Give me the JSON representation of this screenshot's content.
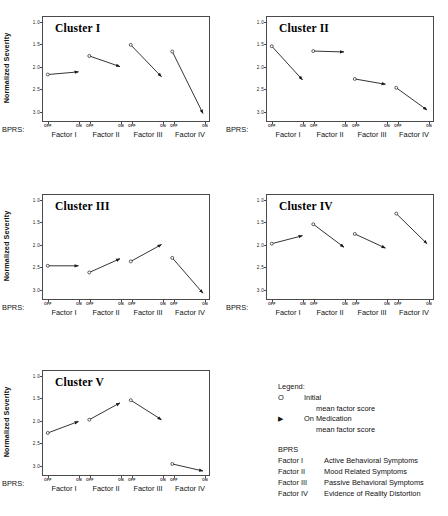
{
  "figure": {
    "axis": {
      "ylabel": "Normalized Severity",
      "xlabel_prefix": "BPRS:",
      "yticks": [
        "3.0",
        "2.5",
        "2.0",
        "1.5",
        "1.0"
      ],
      "ytick_values": [
        3.0,
        2.5,
        2.0,
        1.5,
        1.0
      ],
      "ylim": [
        0.75,
        3.1
      ],
      "factors": [
        "Factor I",
        "Factor II",
        "Factor III",
        "Factor IV"
      ],
      "condition_ticks": [
        "OFF",
        "ON"
      ]
    },
    "panels": [
      {
        "title": "Cluster I",
        "id": "cluster-1"
      },
      {
        "title": "Cluster II",
        "id": "cluster-2"
      },
      {
        "title": "Cluster III",
        "id": "cluster-3"
      },
      {
        "title": "Cluster IV",
        "id": "cluster-4"
      },
      {
        "title": "Cluster V",
        "id": "cluster-5"
      }
    ]
  },
  "legend": {
    "title": "Legend:",
    "entries": [
      {
        "marker": "O",
        "marker_name": "open-circle-marker",
        "label": "Initial",
        "sublabel": "mean factor score"
      },
      {
        "marker": "▶",
        "marker_name": "filled-arrow-marker",
        "label": "On Medication",
        "sublabel": "mean factor score"
      }
    ],
    "bprs_heading": "BPRS",
    "bprs_items": [
      {
        "key": "Factor I",
        "desc": "Active Behavioral Symptoms"
      },
      {
        "key": "Factor II",
        "desc": "Mood Related Symptoms"
      },
      {
        "key": "Factor III",
        "desc": "Passive Behavioral Symptoms"
      },
      {
        "key": "Factor IV",
        "desc": "Evidence of Reality Distortion"
      }
    ]
  },
  "chart_data": {
    "type": "line",
    "xlabel": "BPRS:",
    "ylabel": "Normalized Severity",
    "ylim": [
      0.75,
      3.1
    ],
    "yticks": [
      1.0,
      1.5,
      2.0,
      2.5,
      3.0
    ],
    "grid": false,
    "legend_position": "bottom-right",
    "categories": [
      "Factor I",
      "Factor II",
      "Factor III",
      "Factor IV"
    ],
    "conditions": [
      "OFF",
      "ON"
    ],
    "panels": [
      {
        "name": "Cluster I",
        "series": [
          {
            "name": "Initial",
            "values": [
              1.8,
              2.22,
              2.47,
              2.32
            ]
          },
          {
            "name": "On Medication",
            "values": [
              1.86,
              1.98,
              1.75,
              0.92
            ]
          }
        ]
      },
      {
        "name": "Cluster II",
        "series": [
          {
            "name": "Initial",
            "values": [
              2.44,
              2.33,
              1.7,
              1.5
            ]
          },
          {
            "name": "On Medication",
            "values": [
              1.68,
              2.31,
              1.58,
              1.0
            ]
          }
        ]
      },
      {
        "name": "Cluster III",
        "series": [
          {
            "name": "Initial",
            "values": [
              1.5,
              1.35,
              1.6,
              1.68
            ]
          },
          {
            "name": "On Medication",
            "values": [
              1.5,
              1.66,
              1.98,
              0.88
            ]
          }
        ]
      },
      {
        "name": "Cluster IV",
        "series": [
          {
            "name": "Initial",
            "values": [
              2.0,
              2.44,
              2.22,
              2.68
            ]
          },
          {
            "name": "On Medication",
            "values": [
              2.18,
              1.92,
              1.9,
              2.0
            ]
          }
        ]
      },
      {
        "name": "Cluster V",
        "series": [
          {
            "name": "Initial",
            "values": [
              1.7,
              2.0,
              2.44,
              1.0
            ]
          },
          {
            "name": "On Medication",
            "values": [
              1.96,
              2.38,
              2.0,
              0.84
            ]
          }
        ]
      }
    ]
  }
}
